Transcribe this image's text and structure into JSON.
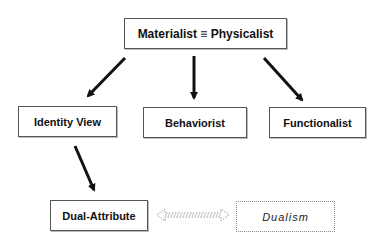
{
  "diagram": {
    "nodes": [
      {
        "id": "materialist",
        "label": "Materialist ≡ Physicalist",
        "style": "solid"
      },
      {
        "id": "identity",
        "label": "Identity View",
        "style": "solid"
      },
      {
        "id": "behaviorist",
        "label": "Behaviorist",
        "style": "solid"
      },
      {
        "id": "functionalist",
        "label": "Functionalist",
        "style": "solid"
      },
      {
        "id": "dual_attribute",
        "label": "Dual-Attribute",
        "style": "solid"
      },
      {
        "id": "dualism",
        "label": "Dualism",
        "style": "dotted"
      }
    ],
    "edges": [
      {
        "from": "materialist",
        "to": "identity",
        "type": "solid-arrow"
      },
      {
        "from": "materialist",
        "to": "behaviorist",
        "type": "solid-arrow"
      },
      {
        "from": "materialist",
        "to": "functionalist",
        "type": "solid-arrow"
      },
      {
        "from": "identity",
        "to": "dual_attribute",
        "type": "solid-arrow"
      },
      {
        "from": "dual_attribute",
        "to": "dualism",
        "type": "dotted-double-arrow"
      }
    ]
  }
}
